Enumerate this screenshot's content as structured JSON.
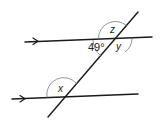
{
  "diagram": {
    "labels": {
      "given_angle": "49°",
      "z": "z",
      "y": "y",
      "x": "x"
    },
    "colors": {
      "line": "#1a1a1a",
      "arc": "#6a6a6a",
      "text": "#222222"
    }
  }
}
